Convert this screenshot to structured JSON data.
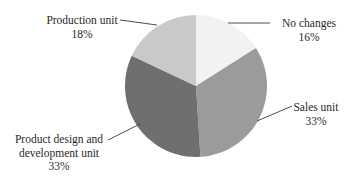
{
  "chart_data": {
    "type": "pie",
    "title": "",
    "start_angle_deg": 0,
    "direction": "clockwise",
    "legend": "none (direct labels with leader lines)",
    "slices": [
      {
        "label": "No changes",
        "value": 16,
        "value_label": "16%",
        "color": "#f2f2f2"
      },
      {
        "label": "Sales unit",
        "value": 33,
        "value_label": "33%",
        "color": "#9b9b9b"
      },
      {
        "label": "Product design and development unit",
        "value": 33,
        "value_label": "33%",
        "color": "#6f6f6f"
      },
      {
        "label": "Production unit",
        "value": 18,
        "value_label": "18%",
        "color": "#c9c9c9"
      }
    ]
  },
  "labels": {
    "no_changes": {
      "line1": "No changes",
      "pct": "16%"
    },
    "sales": {
      "line1": "Sales unit",
      "pct": "33%"
    },
    "product_design": {
      "line1": "Product design and",
      "line2": "development unit",
      "pct": "33%"
    },
    "production": {
      "line1": "Production unit",
      "pct": "18%"
    }
  }
}
